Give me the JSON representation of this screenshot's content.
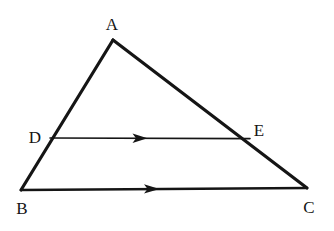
{
  "figure": {
    "background_color": "#ffffff",
    "stroke_color": "#151515",
    "canvas": {
      "width": 334,
      "height": 231
    },
    "points": [
      {
        "id": "A",
        "label": "A",
        "x": 113,
        "y": 40,
        "label_x": 112,
        "label_y": 24
      },
      {
        "id": "B",
        "label": "B",
        "x": 21,
        "y": 190,
        "label_x": 22,
        "label_y": 208
      },
      {
        "id": "C",
        "label": "C",
        "x": 307,
        "y": 188,
        "label_x": 309,
        "label_y": 207
      },
      {
        "id": "D",
        "label": "D",
        "x": 50,
        "y": 138,
        "label_x": 35,
        "label_y": 137
      },
      {
        "id": "E",
        "label": "E",
        "x": 250,
        "y": 139,
        "label_x": 259,
        "label_y": 130
      }
    ],
    "segments": [
      {
        "id": "AB",
        "from": "A",
        "to": "B",
        "x1": 113,
        "y1": 40,
        "x2": 21,
        "y2": 190,
        "width": 3.2,
        "arrow": false
      },
      {
        "id": "AC",
        "from": "A",
        "to": "C",
        "x1": 113,
        "y1": 40,
        "x2": 307,
        "y2": 188,
        "width": 3.2,
        "arrow": false
      },
      {
        "id": "BC",
        "from": "B",
        "to": "C",
        "x1": 21,
        "y1": 190,
        "x2": 307,
        "y2": 188,
        "width": 2.6,
        "arrow": true,
        "arrow_x": 152,
        "arrow_y": 188.9
      },
      {
        "id": "DE",
        "from": "D",
        "to": "E",
        "x1": 50,
        "y1": 138,
        "x2": 250,
        "y2": 138.6,
        "width": 1.6,
        "arrow": true,
        "arrow_x": 140,
        "arrow_y": 138.3
      }
    ],
    "parallel_marks": {
      "description": "single arrowhead on DE and on BC indicating DE is parallel to BC",
      "count": 2
    }
  }
}
